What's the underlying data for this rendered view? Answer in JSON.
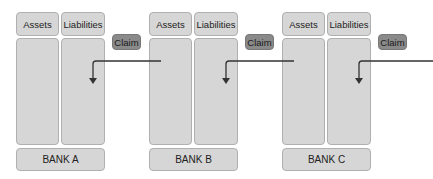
{
  "banks": [
    {
      "name": "BANK A",
      "assets_label": "Assets",
      "liabilities_label": "Liabilities",
      "claim_label": "Claim"
    },
    {
      "name": "BANK B",
      "assets_label": "Assets",
      "liabilities_label": "Liabilities",
      "claim_label": "Claim"
    },
    {
      "name": "BANK C",
      "assets_label": "Assets",
      "liabilities_label": "Liabilities",
      "claim_label": "Claim"
    }
  ],
  "colors": {
    "box": "#d6d6d6",
    "claim": "#8a8a8a",
    "arrow": "#333333"
  }
}
